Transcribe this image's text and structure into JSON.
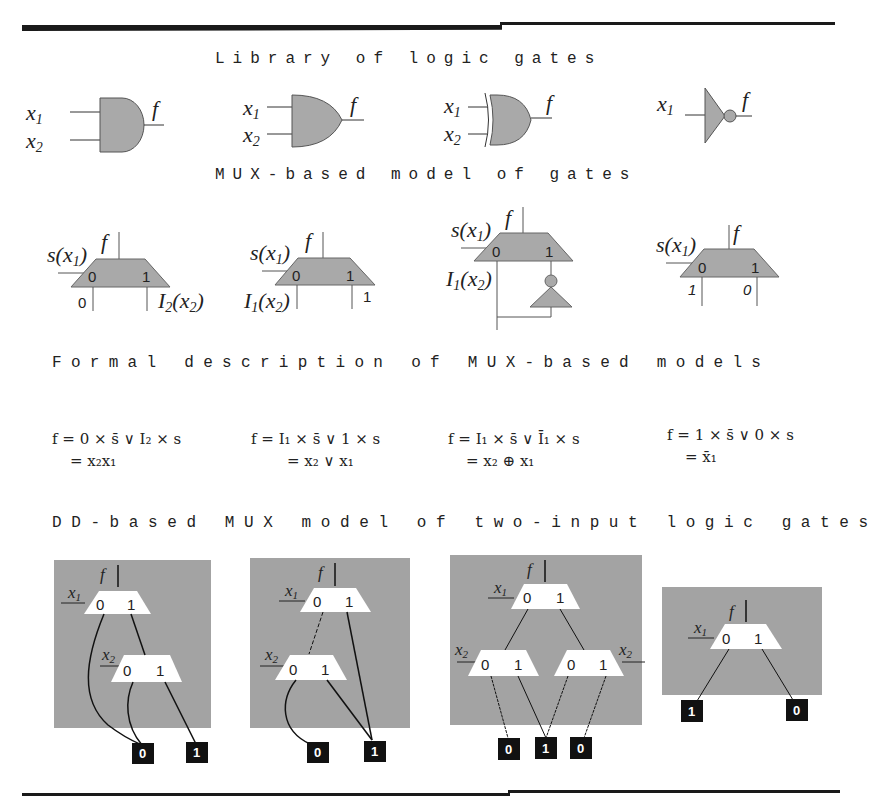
{
  "headings": {
    "library": "Library of logic gates",
    "mux_model": "MUX-based model of gates",
    "formal": "Formal description of MUX-based models",
    "dd_model": "DD-based MUX model of two-input logic gates"
  },
  "library_gates": [
    {
      "type": "AND",
      "inputs": [
        "x1",
        "x2"
      ],
      "output": "f"
    },
    {
      "type": "OR",
      "inputs": [
        "x1",
        "x2"
      ],
      "output": "f"
    },
    {
      "type": "XOR",
      "inputs": [
        "x1",
        "x2"
      ],
      "output": "f"
    },
    {
      "type": "NOT",
      "inputs": [
        "x1"
      ],
      "output": "f"
    }
  ],
  "mux_models": [
    {
      "gate": "AND",
      "select": "s(x1)",
      "output": "f",
      "in0": "0",
      "in1": "I2(x2)",
      "port0": "0",
      "port1": "1"
    },
    {
      "gate": "OR",
      "select": "s(x1)",
      "output": "f",
      "in0": "I1(x2)",
      "in1": "1",
      "port0": "0",
      "port1": "1"
    },
    {
      "gate": "XOR",
      "select": "s(x1)",
      "output": "f",
      "in0": "I1(x2)",
      "in1": "NOT I1(x2)",
      "port0": "0",
      "port1": "1"
    },
    {
      "gate": "NOT",
      "select": "s(x1)",
      "output": "f",
      "in0": "1",
      "in1": "0",
      "port0": "0",
      "port1": "1"
    }
  ],
  "formulas": [
    {
      "line1": "f = 0 × s̄ ∨ I₂ × s",
      "line2": "= x₂x₁"
    },
    {
      "line1": "f = I₁ × s̄ ∨ 1 × s",
      "line2": "= x₂ ∨ x₁"
    },
    {
      "line1": "f = I₁ × s̄ ∨ Ī₁ × s",
      "line2": "= x₂ ⊕ x₁"
    },
    {
      "line1": "f = 1 × s̄ ∨ 0 × s",
      "line2": "= x̄₁"
    }
  ],
  "dd_models": [
    {
      "gate": "AND",
      "root_var": "x1",
      "child_vars": [
        "x2"
      ],
      "terminals": [
        "0",
        "1"
      ]
    },
    {
      "gate": "OR",
      "root_var": "x1",
      "child_vars": [
        "x2"
      ],
      "terminals": [
        "0",
        "1"
      ]
    },
    {
      "gate": "XOR",
      "root_var": "x1",
      "child_vars": [
        "x2",
        "x2"
      ],
      "terminals": [
        "0",
        "1",
        "0"
      ]
    },
    {
      "gate": "NOT",
      "root_var": "x1",
      "child_vars": [],
      "terminals": [
        "1",
        "0"
      ]
    }
  ],
  "labels": {
    "f": "f",
    "x": "x",
    "s_open": "s(x",
    "close": ")",
    "I": "I",
    "sub1": "1",
    "sub2": "2",
    "zero": "0",
    "one": "1",
    "paren_x": "(x",
    "f_eq": "f",
    "eq": "=",
    "F1_a": " = 0 × ",
    "F1_b": " ∨ ",
    "F1_c": " × ",
    "s": "s",
    "F1_r": "= x₂x₁",
    "F2_r": "= x₂ ∨ x₁",
    "F3_r": "= x₂ ⊕ x₁",
    "F4_r": "= ",
    "F4_x": "x",
    "F4_sub": "₁",
    "F2_a": " = ",
    "F2_b": "₁ × ",
    "F2_c": " ∨ 1 × ",
    "F3_c": " ∨ ",
    "F3_d": "₁ × ",
    "F4_a": " = 1 × ",
    "F4_c": " ∨ 0 × ",
    "I2": "₂ × "
  },
  "colors": {
    "gate_fill": "#a9a9a9",
    "dd_background": "#a3a3a3",
    "mux_white": "#ffffff",
    "terminal": "#111111",
    "line": "#1a1a1a"
  }
}
